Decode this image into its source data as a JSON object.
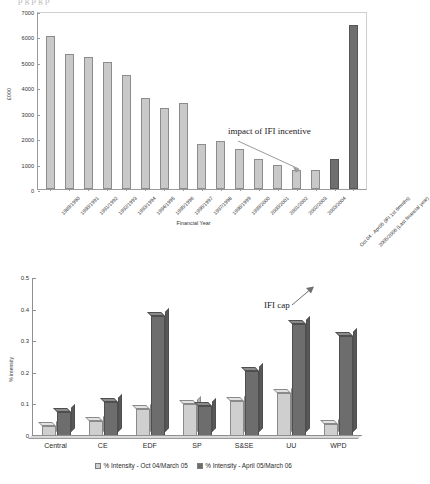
{
  "page": {
    "top_cut_text": "p       g      p       g    p"
  },
  "chart_data": [
    {
      "id": "top-chart",
      "type": "bar",
      "title": "",
      "xlabel": "Financial Year",
      "ylabel": "£000",
      "ylim": [
        0,
        7000
      ],
      "yticks": [
        7000,
        6000,
        5000,
        4000,
        3000,
        2000,
        1000,
        0
      ],
      "grid": false,
      "legend": "none",
      "annotation": "impact of IFI incentive",
      "categories": [
        "1989/1990",
        "1990/1991",
        "1991/1992",
        "1992/1993",
        "1993/1994",
        "1994/1995",
        "1995/1996",
        "1996/1997",
        "1997/1998",
        "1998/1999",
        "1999/2000",
        "2000/2001",
        "2001/2002",
        "2002/2003",
        "2003/2004",
        "Oct 04 - Apr05 (IFI 1st 6mnths)",
        "2005/2006 (Last financial year)"
      ],
      "values": [
        6000,
        5300,
        5200,
        5000,
        4480,
        3580,
        3180,
        3370,
        1770,
        1870,
        1570,
        1180,
        960,
        760,
        760,
        1200,
        6450
      ],
      "bar_colors": [
        "light",
        "light",
        "light",
        "light",
        "light",
        "light",
        "light",
        "light",
        "light",
        "light",
        "light",
        "light",
        "light",
        "light",
        "light",
        "dark",
        "dark"
      ],
      "colors": {
        "light": "#c9c9c9",
        "dark": "#6f6f6f"
      }
    },
    {
      "id": "bottom-chart",
      "type": "bar",
      "title": "",
      "xlabel": "",
      "ylabel": "% intensity",
      "ylim": [
        0,
        0.5
      ],
      "yticks": [
        "0.5",
        "0.4",
        "0.3",
        "0.2",
        "0.1",
        "0"
      ],
      "grid": false,
      "legend_position": "bottom",
      "annotation": "IFI cap",
      "categories": [
        "Central",
        "CE",
        "EDF",
        "SP",
        "S&SE",
        "UU",
        "WPD"
      ],
      "series": [
        {
          "name": "% Intensity - Oct 04/March 05",
          "color": "#cfcfcf",
          "values": [
            0.031,
            0.048,
            0.085,
            0.102,
            0.112,
            0.135,
            0.038
          ]
        },
        {
          "name": "% Intensity - April 05/March 06",
          "color": "#6d6d6d",
          "values": [
            0.076,
            0.108,
            0.38,
            0.094,
            0.205,
            0.353,
            0.317
          ]
        }
      ]
    }
  ]
}
